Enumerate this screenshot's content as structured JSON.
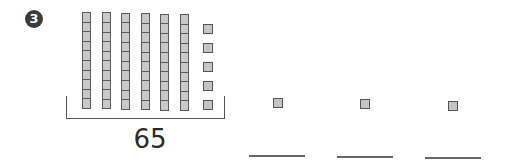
{
  "problem": {
    "number": "3",
    "total_label": "65",
    "tens_rods": 6,
    "cubes_per_rod": 10,
    "ones_cubes": 5,
    "answer_choices": [
      {
        "cubes": 1,
        "blank": ""
      },
      {
        "cubes": 1,
        "blank": ""
      },
      {
        "cubes": 1,
        "blank": ""
      }
    ]
  },
  "colors": {
    "cube_fill": "#c8c8c8",
    "cube_border": "#5a5a5a",
    "badge": "#3b3b3b"
  }
}
